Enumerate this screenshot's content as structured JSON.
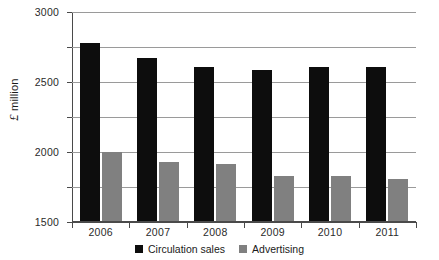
{
  "chart_data": {
    "type": "bar",
    "title": "",
    "subtitle": "",
    "xlabel": "",
    "ylabel": "£ million",
    "ylabel_currency": "£",
    "ylabel_text": "million",
    "categories": [
      "2006",
      "2007",
      "2008",
      "2009",
      "2010",
      "2011"
    ],
    "series": [
      {
        "name": "Circulation sales",
        "color": "#0d0d0d",
        "values": [
          2560,
          2340,
          2210,
          2170,
          2220,
          2220
        ]
      },
      {
        "name": "Advertising",
        "color": "#808080",
        "values": [
          1000,
          860,
          830,
          660,
          660,
          620
        ]
      }
    ],
    "ylim": [
      0,
      3000
    ],
    "ytick_step": 500,
    "yticks": [
      0,
      500,
      1000,
      1500,
      2000,
      2500,
      3000
    ],
    "ytick_labels": [
      "0",
      "500",
      "1000",
      "1500",
      "2000",
      "2500",
      "3000"
    ],
    "grid": true,
    "grid_axis": "y",
    "legend_position": "bottom-center",
    "background_color": "#ffffff",
    "grid_color": "#9a9a9a",
    "axis_color": "#4a4a4a"
  }
}
